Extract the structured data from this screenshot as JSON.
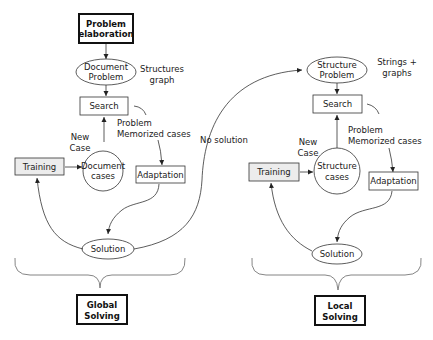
{
  "diagram": {
    "top": {
      "problem_elaboration": [
        "Problem",
        "elaboration"
      ]
    },
    "global": {
      "problem": [
        "Document",
        "Problem"
      ],
      "problem_note": [
        "Structures",
        "graph"
      ],
      "search": "Search",
      "new_case": [
        "New",
        "Case"
      ],
      "cases": [
        "Document",
        "cases"
      ],
      "memorized": [
        "Problem",
        "Memorized cases"
      ],
      "training": "Training",
      "adaptation": "Adaptation",
      "solution": "Solution",
      "result": [
        "Global",
        "Solving"
      ]
    },
    "transition": {
      "no_solution": "No solution"
    },
    "local": {
      "problem": [
        "Structure",
        "Problem"
      ],
      "problem_note": [
        "Strings +",
        "graphs"
      ],
      "search": "Search",
      "new_case": [
        "New",
        "Case"
      ],
      "cases": [
        "Structure",
        "cases"
      ],
      "memorized": [
        "Problem",
        "Memorized cases"
      ],
      "training": "Training",
      "adaptation": "Adaptation",
      "solution": "Solution",
      "result": [
        "Local",
        "Solving"
      ]
    }
  }
}
